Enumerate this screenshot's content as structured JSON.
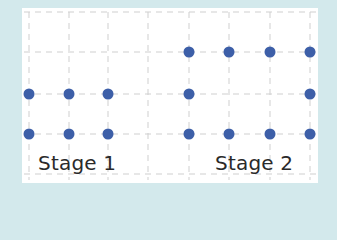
{
  "diagram": {
    "background_color": "#d3e9ec",
    "panel_color": "#ffffff",
    "grid_color": "#cfcfcf",
    "dot_color": "#3d5fa8",
    "grid": {
      "columns_x": [
        29,
        69,
        108,
        148,
        189,
        229,
        270,
        310
      ],
      "rows_y": [
        12,
        52,
        94,
        134,
        174
      ]
    },
    "stages": [
      {
        "label": "Stage 1",
        "dots": [
          [
            29,
            94
          ],
          [
            69,
            94
          ],
          [
            108,
            94
          ],
          [
            29,
            134
          ],
          [
            69,
            134
          ],
          [
            108,
            134
          ]
        ]
      },
      {
        "label": "Stage 2",
        "dots": [
          [
            189,
            52
          ],
          [
            229,
            52
          ],
          [
            270,
            52
          ],
          [
            310,
            52
          ],
          [
            189,
            94
          ],
          [
            310,
            94
          ],
          [
            189,
            134
          ],
          [
            229,
            134
          ],
          [
            270,
            134
          ],
          [
            310,
            134
          ]
        ]
      }
    ]
  }
}
